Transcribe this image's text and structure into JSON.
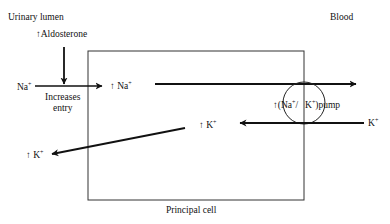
{
  "diagram": {
    "type": "physiology-schematic",
    "regions": {
      "lumen": "Urinary lumen",
      "blood": "Blood",
      "cell": "Principal cell"
    },
    "labels": {
      "aldosterone": "↑Aldosterone",
      "na_outside": "Na",
      "na_inside": "↑ Na",
      "increases_entry_1": "Increases",
      "increases_entry_2": "entry",
      "pump_prefix": "↑",
      "pump_na": "Na",
      "pump_sep": "/",
      "pump_k": "K",
      "pump_word": "pump",
      "k_blood": "K",
      "k_inside": "↑ K",
      "k_lumen": "↑ K",
      "plus": "+"
    },
    "colors": {
      "line": "#111111",
      "box": "#333333",
      "background": "#ffffff"
    }
  }
}
